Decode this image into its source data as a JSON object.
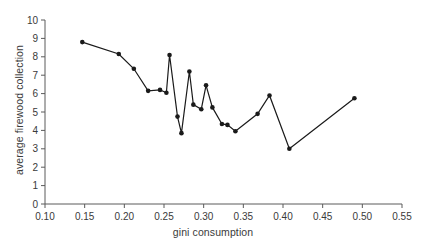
{
  "chart_data": {
    "type": "line",
    "title": "",
    "xlabel": "gini consumption",
    "ylabel": "average firewood collection",
    "xlim": [
      0.1,
      0.55
    ],
    "ylim": [
      0,
      10
    ],
    "xticks": [
      "0.10",
      "0.15",
      "0.20",
      "0.25",
      "0.30",
      "0.35",
      "0.40",
      "0.45",
      "0.50",
      "0.55"
    ],
    "yticks": [
      "0",
      "1",
      "2",
      "3",
      "4",
      "5",
      "6",
      "7",
      "8",
      "9",
      "10"
    ],
    "xtick_values": [
      0.1,
      0.15,
      0.2,
      0.25,
      0.3,
      0.35,
      0.4,
      0.45,
      0.5,
      0.55
    ],
    "ytick_values": [
      0,
      1,
      2,
      3,
      4,
      5,
      6,
      7,
      8,
      9,
      10
    ],
    "grid": false,
    "legend": false,
    "marker": "filled-circle",
    "line_color": "#1a1a1a",
    "marker_color": "#1a1a1a",
    "x": [
      0.147,
      0.193,
      0.212,
      0.23,
      0.245,
      0.253,
      0.257,
      0.267,
      0.272,
      0.282,
      0.287,
      0.297,
      0.303,
      0.311,
      0.323,
      0.33,
      0.34,
      0.368,
      0.383,
      0.408,
      0.49
    ],
    "y": [
      8.8,
      8.15,
      7.35,
      6.15,
      6.2,
      6.05,
      8.1,
      4.75,
      3.85,
      7.2,
      5.4,
      5.15,
      6.45,
      5.25,
      4.35,
      4.3,
      3.95,
      4.9,
      5.9,
      3.0,
      5.75
    ],
    "points": [
      {
        "x": 0.147,
        "y": 8.8
      },
      {
        "x": 0.193,
        "y": 8.15
      },
      {
        "x": 0.212,
        "y": 7.35
      },
      {
        "x": 0.23,
        "y": 6.15
      },
      {
        "x": 0.245,
        "y": 6.2
      },
      {
        "x": 0.253,
        "y": 6.05
      },
      {
        "x": 0.257,
        "y": 8.1
      },
      {
        "x": 0.267,
        "y": 4.75
      },
      {
        "x": 0.272,
        "y": 3.85
      },
      {
        "x": 0.282,
        "y": 7.2
      },
      {
        "x": 0.287,
        "y": 5.4
      },
      {
        "x": 0.297,
        "y": 5.15
      },
      {
        "x": 0.303,
        "y": 6.45
      },
      {
        "x": 0.311,
        "y": 5.25
      },
      {
        "x": 0.323,
        "y": 4.35
      },
      {
        "x": 0.33,
        "y": 4.3
      },
      {
        "x": 0.34,
        "y": 3.95
      },
      {
        "x": 0.368,
        "y": 4.9
      },
      {
        "x": 0.383,
        "y": 5.9
      },
      {
        "x": 0.408,
        "y": 3.0
      },
      {
        "x": 0.49,
        "y": 5.75
      }
    ]
  }
}
